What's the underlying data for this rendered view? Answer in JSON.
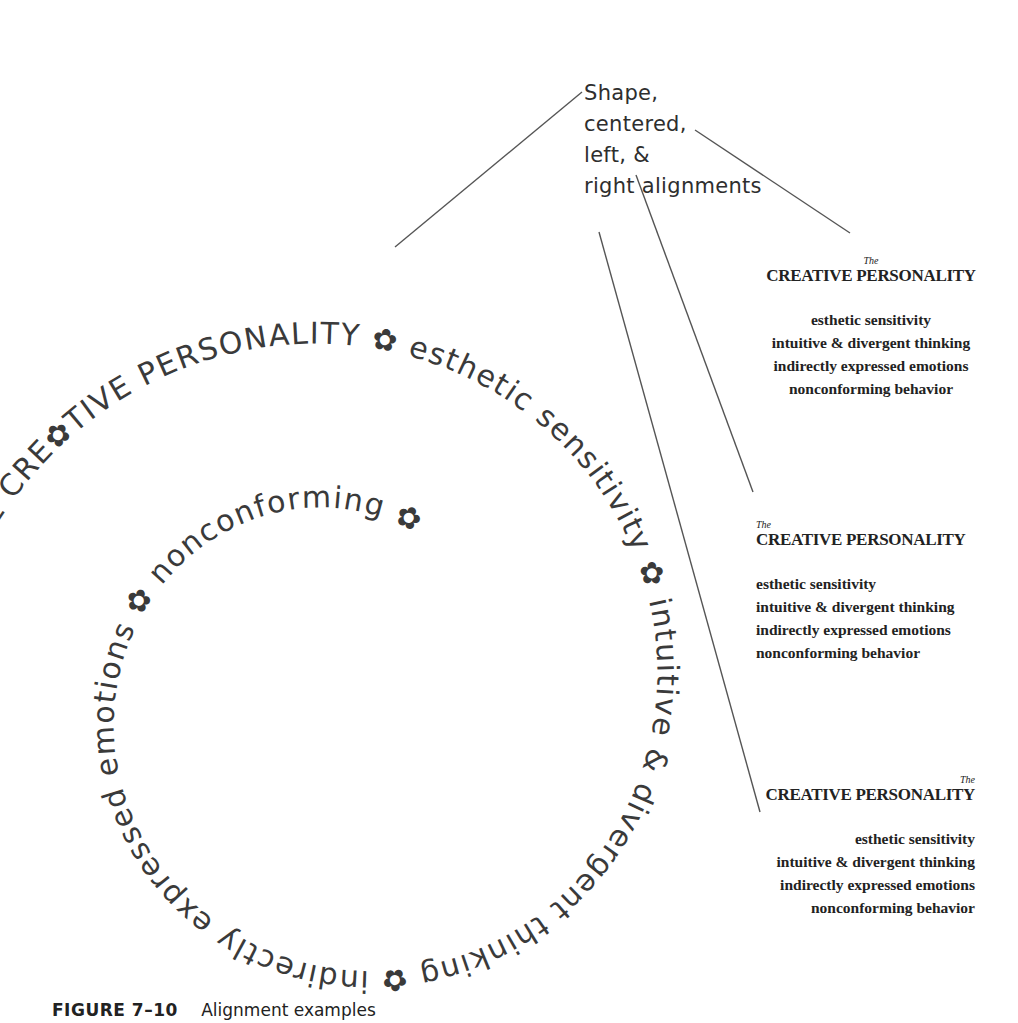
{
  "annotation": {
    "lines": [
      "Shape,",
      "centered,",
      "left, &",
      "right alignments"
    ]
  },
  "spiral": {
    "segments": [
      {
        "text": "THE CRE✿TIVE PERSONALITY",
        "style": "caps"
      },
      {
        "text": "✿",
        "style": "flower"
      },
      {
        "text": "esthetic sensitivity",
        "style": "lower"
      },
      {
        "text": "✿",
        "style": "flower"
      },
      {
        "text": "intuitive & divergent thinking",
        "style": "lower"
      },
      {
        "text": "✿",
        "style": "flower"
      },
      {
        "text": "indirectly expressed emotions",
        "style": "lower"
      },
      {
        "text": "✿",
        "style": "flower"
      },
      {
        "text": "nonconforming",
        "style": "lower"
      },
      {
        "text": "✿",
        "style": "flower"
      }
    ],
    "full_text": "THE CRE✿TIVE PERSONALITY ✿ esthetic sensitivity ✿ intuitive & divergent thinking ✿ indirectly expressed emotions ✿ nonconforming ✿"
  },
  "examples": {
    "centered": {
      "the": "The",
      "title": "CREATIVE PERSONALITY",
      "lines": [
        "esthetic sensitivity",
        "intuitive & divergent thinking",
        "indirectly expressed emotions",
        "nonconforming behavior"
      ]
    },
    "left": {
      "the": "The",
      "title": "CREATIVE PERSONALITY",
      "lines": [
        "esthetic sensitivity",
        "intuitive & divergent thinking",
        "indirectly expressed emotions",
        "nonconforming behavior"
      ]
    },
    "right": {
      "the": "The",
      "title": "CREATIVE PERSONALITY",
      "lines": [
        "esthetic sensitivity",
        "intuitive & divergent thinking",
        "indirectly expressed emotions",
        "nonconforming behavior"
      ]
    }
  },
  "caption": {
    "figure": "FIGURE 7–10",
    "text": "Alignment examples"
  },
  "colors": {
    "ink": "#3a3a3a",
    "leader": "#555555",
    "background": "#ffffff"
  }
}
